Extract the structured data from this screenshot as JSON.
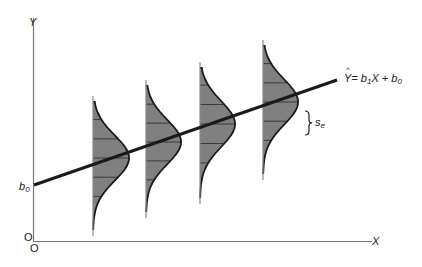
{
  "diagram": {
    "axes": {
      "y_label": "Y",
      "x_label": "X",
      "origin_x_label": "O",
      "origin_y_label": "O"
    },
    "intercept_label": {
      "base": "b",
      "sub": "0"
    },
    "equation": {
      "lhs": "Y",
      "hat": "^",
      "text": "= b",
      "b1_sub": "1",
      "mid": "X + b",
      "b0_sub": "0"
    },
    "spread_label": {
      "base": "s",
      "sub": "e"
    },
    "colors": {
      "line": "#1a1a1a",
      "axis": "#777777",
      "fill": "#808080",
      "hatch": "#2a2a2a",
      "background": "#ffffff"
    },
    "regression_line": {
      "x1": 34,
      "y1": 185,
      "x2": 337,
      "y2": 80
    },
    "distributions": [
      {
        "base_x": 93,
        "top": 96,
        "bottom": 236,
        "peak_y": 158,
        "peak_w": 36
      },
      {
        "base_x": 146,
        "top": 80,
        "bottom": 218,
        "peak_y": 142,
        "peak_w": 35
      },
      {
        "base_x": 200,
        "top": 62,
        "bottom": 204,
        "peak_y": 124,
        "peak_w": 35
      },
      {
        "base_x": 263,
        "top": 40,
        "bottom": 180,
        "peak_y": 102,
        "peak_w": 35
      }
    ]
  }
}
